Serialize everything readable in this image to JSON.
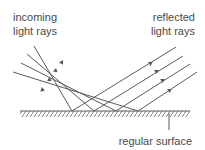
{
  "labels": {
    "incoming_line1": "incoming",
    "incoming_line2": "light rays",
    "reflected_line1": "reflected",
    "reflected_line2": "light rays",
    "surface": "regular surface"
  },
  "colors": {
    "stroke": "#5a5a5a",
    "text": "#4a4a4a",
    "background": "#ffffff"
  },
  "diagram": {
    "type": "specular reflection",
    "ray_count": 4,
    "incoming_rays": [
      {
        "start": [
          34,
          46
        ],
        "hit": [
          72,
          111
        ],
        "arrow": [
          62,
          63
        ]
      },
      {
        "start": [
          27,
          54
        ],
        "hit": [
          94,
          111
        ],
        "arrow": [
          56,
          71
        ]
      },
      {
        "start": [
          21,
          63
        ],
        "hit": [
          116,
          111
        ],
        "arrow": [
          50,
          80
        ]
      },
      {
        "start": [
          13,
          72
        ],
        "hit": [
          138,
          111
        ],
        "arrow": [
          43,
          90
        ]
      }
    ],
    "reflected_rays": [
      {
        "hit": [
          72,
          111
        ],
        "end": [
          176,
          47
        ],
        "arrow": [
          151,
          63
        ]
      },
      {
        "hit": [
          94,
          111
        ],
        "end": [
          183,
          56
        ],
        "arrow": [
          157,
          71
        ]
      },
      {
        "hit": [
          116,
          111
        ],
        "end": [
          190,
          64
        ],
        "arrow": [
          163,
          80
        ]
      },
      {
        "hit": [
          138,
          111
        ],
        "end": [
          197,
          72
        ],
        "arrow": [
          170,
          90
        ]
      }
    ],
    "surface": {
      "x1": 20,
      "x2": 190,
      "y": 111
    }
  }
}
